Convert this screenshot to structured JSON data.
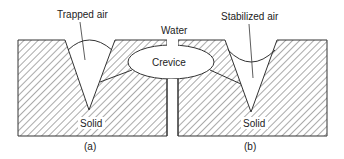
{
  "diagram": {
    "labels": {
      "trapped_air": "Trapped air",
      "water": "Water",
      "stabilized_air": "Stabilized air",
      "crevice": "Crevice",
      "solid_left": "Solid",
      "solid_right": "Solid",
      "caption_a": "(a)",
      "caption_b": "(b)"
    },
    "colors": {
      "stroke": "#333333",
      "hatch": "#555555",
      "background": "#ffffff"
    },
    "panels": [
      {
        "id": "a",
        "description": "Trapped air in V-shaped crevice with convex meniscus"
      },
      {
        "id": "b",
        "description": "Stabilized air in V-shaped crevice with concave meniscus"
      }
    ]
  }
}
